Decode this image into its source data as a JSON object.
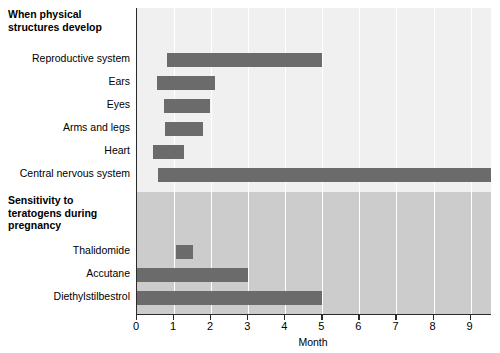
{
  "figure": {
    "background_color": "#ffffff",
    "bar_color": "#6b6b6b",
    "upper_band_color": "#f0f0f0",
    "lower_band_color": "#cccccc",
    "axis_color": "#2b2b2b"
  },
  "sections": [
    {
      "id": "physical-structures",
      "heading": "When physical\nstructures develop"
    },
    {
      "id": "teratogen-sensitivity",
      "heading": "Sensitivity to\nteratogens during\npregnancy"
    }
  ],
  "axis": {
    "title": "Month",
    "ticks": [
      "0",
      "1",
      "2",
      "3",
      "4",
      "5",
      "6",
      "7",
      "8",
      "9"
    ],
    "min": 0,
    "max": 9.55
  },
  "chart_data": {
    "type": "bar",
    "orientation": "horizontal",
    "title": "",
    "subtitle": "",
    "xlabel": "Month",
    "ylabel": "",
    "xlim": [
      0,
      9.55
    ],
    "xticks": [
      0,
      1,
      2,
      3,
      4,
      5,
      6,
      7,
      8,
      9
    ],
    "grid": "vertical",
    "legend": "none",
    "groups": [
      {
        "name": "When physical structures develop",
        "background": "#f0f0f0",
        "bars": [
          {
            "category": "Reproductive system",
            "start": 0.8,
            "end": 5.0
          },
          {
            "category": "Ears",
            "start": 0.55,
            "end": 2.1
          },
          {
            "category": "Eyes",
            "start": 0.72,
            "end": 1.97
          },
          {
            "category": "Arms and legs",
            "start": 0.75,
            "end": 1.78
          },
          {
            "category": "Heart",
            "start": 0.42,
            "end": 1.27
          },
          {
            "category": "Central nervous system",
            "start": 0.58,
            "end": 9.55
          }
        ]
      },
      {
        "name": "Sensitivity to teratogens during pregnancy",
        "background": "#cccccc",
        "bars": [
          {
            "category": "Thalidomide",
            "start": 1.05,
            "end": 1.5
          },
          {
            "category": "Accutane",
            "start": 0.0,
            "end": 3.0
          },
          {
            "category": "Diethylstilbestrol",
            "start": 0.0,
            "end": 5.0
          }
        ]
      }
    ],
    "categories": [
      "Reproductive system",
      "Ears",
      "Eyes",
      "Arms and legs",
      "Heart",
      "Central nervous system",
      "Thalidomide",
      "Accutane",
      "Diethylstilbestrol"
    ],
    "starts": [
      0.8,
      0.55,
      0.72,
      0.75,
      0.42,
      0.58,
      1.05,
      0.0,
      0.0
    ],
    "ends": [
      5.0,
      2.1,
      1.97,
      1.78,
      1.27,
      9.55,
      1.5,
      3.0,
      5.0
    ]
  },
  "rows": [
    {
      "label": "Reproductive system",
      "y": 53,
      "start": 0.8,
      "end": 5.0
    },
    {
      "label": "Ears",
      "y": 76,
      "start": 0.55,
      "end": 2.1
    },
    {
      "label": "Eyes",
      "y": 99,
      "start": 0.72,
      "end": 1.97
    },
    {
      "label": "Arms and legs",
      "y": 122,
      "start": 0.75,
      "end": 1.78
    },
    {
      "label": "Heart",
      "y": 145,
      "start": 0.42,
      "end": 1.27
    },
    {
      "label": "Central nervous system",
      "y": 168,
      "start": 0.58,
      "end": 9.55
    },
    {
      "label": "Thalidomide",
      "y": 245,
      "start": 1.05,
      "end": 1.5
    },
    {
      "label": "Accutane",
      "y": 268,
      "start": 0.0,
      "end": 3.0
    },
    {
      "label": "Diethylstilbestrol",
      "y": 291,
      "start": 0.0,
      "end": 5.0
    }
  ]
}
